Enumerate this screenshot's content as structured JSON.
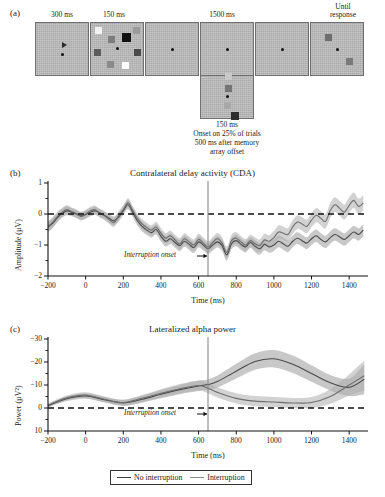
{
  "figure": {
    "panels": [
      {
        "letter": "(a)"
      },
      {
        "letter": "(b)"
      },
      {
        "letter": "(c)"
      }
    ]
  },
  "panel_a": {
    "letter": "(a)",
    "durations": [
      {
        "label": "300 ms",
        "frame": 0
      },
      {
        "label": "150 ms",
        "frame": 1
      },
      {
        "label": "1500 ms",
        "frame": 3
      },
      {
        "label": "Until\nresponse",
        "frame": 5
      }
    ],
    "duration_labels": {
      "cue": "300 ms",
      "memory_array": "150 ms",
      "retention": "1500 ms",
      "test": "Until response",
      "test_line1": "Until",
      "test_line2": "response"
    },
    "interruption": {
      "duration": "150 ms",
      "caption_line1": "Onset on 25% of trials",
      "caption_line2": "500 ms after memory",
      "caption_line3": "array offset"
    },
    "frame_bg": "#b4b4b4",
    "frame_border": "#6f6f6f",
    "memory_array_colors": [
      "#f2f2f2",
      "#7d7d7d",
      "#111111",
      "#9a9a9a",
      "#5c5c5c",
      "#6b6b6b",
      "#8a8a8a",
      "#4a4a4a",
      "#fcfcfc"
    ],
    "test_array_colors": [
      "#6e6e6e",
      "#7a7a7a"
    ],
    "interruption_colors": [
      "#c9c9c9",
      "#757575",
      "#a8a8a8",
      "#2e2e2e"
    ]
  },
  "panel_b": {
    "letter": "(b)",
    "chart_data": {
      "type": "line",
      "title": "Contralateral delay activity (CDA)",
      "xlabel": "Time (ms)",
      "ylabel": "Amplitude (µV)",
      "xlim": [
        -200,
        1500
      ],
      "ylim": [
        1,
        -2
      ],
      "y_inverted": true,
      "xticks": [
        -200,
        0,
        200,
        400,
        600,
        800,
        1000,
        1200,
        1400
      ],
      "yticks": [
        -2,
        -1,
        0,
        1
      ],
      "ytick_labels": [
        "−2",
        "−1",
        "0",
        "1"
      ],
      "xtick_labels": [
        "−200",
        "0",
        "200",
        "400",
        "600",
        "800",
        "1000",
        "1200",
        "1400"
      ],
      "grid": false,
      "zero_line": 0,
      "annotation": "Interruption onset",
      "annotation_x": 650,
      "legend_position": "below figure",
      "series": [
        {
          "name": "No interruption",
          "color": "#4a4a4a",
          "band_color": "#9b9b9b",
          "x": [
            -200,
            -175,
            -150,
            -125,
            -100,
            -75,
            -50,
            -25,
            0,
            25,
            50,
            75,
            100,
            125,
            150,
            175,
            200,
            225,
            250,
            275,
            300,
            325,
            350,
            375,
            400,
            425,
            450,
            475,
            500,
            525,
            550,
            575,
            600,
            625,
            650,
            675,
            700,
            725,
            750,
            775,
            800,
            825,
            850,
            875,
            900,
            925,
            950,
            975,
            1000,
            1025,
            1050,
            1075,
            1100,
            1125,
            1150,
            1175,
            1200,
            1225,
            1250,
            1275,
            1300,
            1325,
            1350,
            1375,
            1400,
            1425,
            1450,
            1475
          ],
          "values": [
            -0.42,
            -0.3,
            -0.12,
            0.02,
            0.1,
            0.06,
            0.0,
            -0.06,
            -0.02,
            0.06,
            0.1,
            0.04,
            -0.04,
            -0.14,
            -0.22,
            -0.1,
            0.1,
            0.3,
            0.06,
            -0.22,
            -0.4,
            -0.52,
            -0.6,
            -0.5,
            -0.72,
            -0.88,
            -0.8,
            -0.92,
            -1.02,
            -0.88,
            -0.98,
            -1.08,
            -0.9,
            -1.0,
            -1.12,
            -1.0,
            -0.9,
            -1.02,
            -1.32,
            -0.96,
            -0.86,
            -0.98,
            -1.06,
            -0.92,
            -1.04,
            -1.12,
            -0.98,
            -1.06,
            -1.0,
            -0.88,
            -0.96,
            -1.04,
            -0.88,
            -0.78,
            -0.86,
            -0.94,
            -0.8,
            -0.7,
            -0.82,
            -0.9,
            -0.76,
            -0.66,
            -0.74,
            -0.82,
            -0.7,
            -0.58,
            -0.66,
            -0.52
          ],
          "band": [
            0.16,
            0.16,
            0.15,
            0.14,
            0.14,
            0.13,
            0.13,
            0.13,
            0.13,
            0.13,
            0.13,
            0.13,
            0.13,
            0.14,
            0.14,
            0.14,
            0.14,
            0.15,
            0.15,
            0.15,
            0.16,
            0.16,
            0.16,
            0.16,
            0.17,
            0.17,
            0.17,
            0.17,
            0.18,
            0.18,
            0.18,
            0.18,
            0.18,
            0.18,
            0.18,
            0.18,
            0.18,
            0.18,
            0.18,
            0.18,
            0.18,
            0.18,
            0.18,
            0.18,
            0.19,
            0.19,
            0.19,
            0.19,
            0.19,
            0.19,
            0.19,
            0.19,
            0.19,
            0.19,
            0.19,
            0.19,
            0.2,
            0.2,
            0.2,
            0.2,
            0.2,
            0.2,
            0.2,
            0.2,
            0.2,
            0.2,
            0.2,
            0.2
          ]
        },
        {
          "name": "Interruption",
          "color": "#6d6d6d",
          "band_color": "#adadad",
          "x": [
            -200,
            -175,
            -150,
            -125,
            -100,
            -75,
            -50,
            -25,
            0,
            25,
            50,
            75,
            100,
            125,
            150,
            175,
            200,
            225,
            250,
            275,
            300,
            325,
            350,
            375,
            400,
            425,
            450,
            475,
            500,
            525,
            550,
            575,
            600,
            625,
            650,
            675,
            700,
            725,
            750,
            775,
            800,
            825,
            850,
            875,
            900,
            925,
            950,
            975,
            1000,
            1025,
            1050,
            1075,
            1100,
            1125,
            1150,
            1175,
            1200,
            1225,
            1250,
            1275,
            1300,
            1325,
            1350,
            1375,
            1400,
            1425,
            1450,
            1475
          ],
          "values": [
            -0.4,
            -0.26,
            -0.08,
            0.06,
            0.14,
            0.08,
            0.02,
            -0.08,
            0.0,
            0.1,
            0.14,
            0.02,
            -0.06,
            -0.18,
            -0.28,
            -0.06,
            0.14,
            0.36,
            0.12,
            -0.14,
            -0.32,
            -0.44,
            -0.52,
            -0.42,
            -0.62,
            -0.78,
            -0.7,
            -0.84,
            -0.96,
            -0.8,
            -0.9,
            -1.0,
            -0.82,
            -0.94,
            -1.06,
            -0.92,
            -0.8,
            -0.94,
            -1.24,
            -0.86,
            -0.78,
            -0.9,
            -1.0,
            -0.86,
            -0.96,
            -1.02,
            -0.84,
            -0.88,
            -0.76,
            -0.58,
            -0.62,
            -0.66,
            -0.42,
            -0.26,
            -0.32,
            -0.4,
            -0.2,
            -0.04,
            -0.14,
            -0.24,
            0.12,
            0.3,
            0.18,
            0.06,
            0.28,
            0.44,
            0.24,
            0.36
          ],
          "band": [
            0.16,
            0.16,
            0.15,
            0.14,
            0.14,
            0.13,
            0.13,
            0.13,
            0.13,
            0.13,
            0.13,
            0.13,
            0.13,
            0.14,
            0.14,
            0.14,
            0.14,
            0.15,
            0.15,
            0.15,
            0.16,
            0.16,
            0.16,
            0.16,
            0.17,
            0.17,
            0.17,
            0.17,
            0.18,
            0.18,
            0.18,
            0.18,
            0.18,
            0.18,
            0.18,
            0.18,
            0.19,
            0.19,
            0.19,
            0.19,
            0.19,
            0.19,
            0.19,
            0.19,
            0.2,
            0.2,
            0.2,
            0.2,
            0.21,
            0.21,
            0.21,
            0.21,
            0.22,
            0.22,
            0.22,
            0.22,
            0.23,
            0.23,
            0.23,
            0.23,
            0.24,
            0.24,
            0.24,
            0.24,
            0.25,
            0.25,
            0.25,
            0.25
          ]
        }
      ]
    }
  },
  "panel_c": {
    "letter": "(c)",
    "chart_data": {
      "type": "line",
      "title": "Lateralized alpha power",
      "xlabel": "Time (ms)",
      "ylabel": "Power (µV²)",
      "xlim": [
        -200,
        1500
      ],
      "ylim": [
        -30,
        10
      ],
      "y_inverted": false,
      "xticks": [
        -200,
        0,
        200,
        400,
        600,
        800,
        1000,
        1200,
        1400
      ],
      "yticks": [
        10,
        0,
        -10,
        -20,
        -30
      ],
      "ytick_labels": [
        "10",
        "0",
        "−10",
        "−20",
        "−30"
      ],
      "xtick_labels": [
        "−200",
        "0",
        "200",
        "400",
        "600",
        "800",
        "1000",
        "1200",
        "1400"
      ],
      "grid": false,
      "zero_line": 0,
      "annotation": "Interruption onset",
      "annotation_x": 650,
      "legend_position": "below figure",
      "series": [
        {
          "name": "No interruption",
          "color": "#4a4a4a",
          "band_color": "#9b9b9b",
          "x": [
            -200,
            -100,
            0,
            100,
            200,
            300,
            400,
            500,
            600,
            650,
            700,
            800,
            900,
            1000,
            1100,
            1200,
            1300,
            1400,
            1480
          ],
          "values": [
            -1.0,
            -4.0,
            -5.2,
            -3.6,
            -2.2,
            -3.8,
            -6.0,
            -8.0,
            -9.6,
            -10.2,
            -11.5,
            -16.0,
            -20.2,
            -21.4,
            -19.0,
            -15.0,
            -11.0,
            -9.0,
            -12.5
          ],
          "band": [
            0.8,
            1.0,
            1.2,
            1.2,
            1.3,
            1.5,
            1.8,
            2.0,
            2.2,
            2.3,
            2.6,
            3.2,
            3.6,
            3.8,
            3.8,
            3.6,
            3.4,
            3.8,
            6.5
          ]
        },
        {
          "name": "Interruption",
          "color": "#6d6d6d",
          "band_color": "#adadad",
          "x": [
            -200,
            -100,
            0,
            100,
            200,
            300,
            400,
            500,
            600,
            650,
            700,
            800,
            900,
            1000,
            1100,
            1200,
            1300,
            1400,
            1480
          ],
          "values": [
            -1.2,
            -4.4,
            -5.6,
            -3.8,
            -2.4,
            -4.2,
            -6.4,
            -8.4,
            -9.8,
            -8.6,
            -6.8,
            -4.2,
            -3.0,
            -2.6,
            -2.2,
            -2.4,
            -5.0,
            -10.0,
            -14.0
          ],
          "band": [
            0.8,
            1.0,
            1.2,
            1.2,
            1.3,
            1.5,
            1.8,
            2.0,
            2.2,
            2.2,
            2.2,
            2.2,
            2.2,
            2.2,
            2.2,
            2.4,
            3.2,
            4.6,
            6.5
          ]
        }
      ]
    }
  },
  "legend": {
    "items": [
      {
        "label": "No interruption",
        "color": "#3f3f3f"
      },
      {
        "label": "Interruption",
        "color": "#8a8a8a"
      }
    ]
  }
}
